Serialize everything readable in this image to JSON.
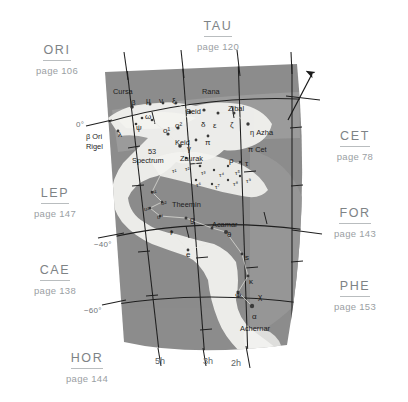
{
  "chart_data": {
    "type": "map",
    "projection": "conic sector",
    "grid": true,
    "declination_labels": [
      "0°",
      "−40°",
      "−60°"
    ],
    "right_ascension_labels": [
      "5h",
      "3h",
      "2h"
    ],
    "north_arrow": "north-arrow",
    "stars": [
      {
        "label": "Cursa",
        "x": 113,
        "y": 88,
        "cls": "nm"
      },
      {
        "label": "β",
        "x": 131,
        "y": 99,
        "cls": "gk"
      },
      {
        "label": "μ",
        "x": 146,
        "y": 97,
        "cls": "gk"
      },
      {
        "label": "ν",
        "x": 159,
        "y": 97,
        "cls": "gk"
      },
      {
        "label": "ξ",
        "x": 172,
        "y": 97,
        "cls": "gk"
      },
      {
        "label": "Rana",
        "x": 202,
        "y": 88,
        "cls": "nm"
      },
      {
        "label": "Beid",
        "x": 186,
        "y": 108,
        "cls": "nm"
      },
      {
        "label": "Zibal",
        "x": 228,
        "y": 105,
        "cls": "nm"
      },
      {
        "label": "ω",
        "x": 145,
        "y": 113,
        "cls": "gk"
      },
      {
        "label": "o²",
        "x": 175,
        "y": 122,
        "cls": "gk"
      },
      {
        "label": "δ",
        "x": 201,
        "y": 121,
        "cls": "gk"
      },
      {
        "label": "ε",
        "x": 213,
        "y": 122,
        "cls": "gk"
      },
      {
        "label": "ζ",
        "x": 230,
        "y": 121,
        "cls": "gk"
      },
      {
        "label": "η Azha",
        "x": 250,
        "y": 129,
        "cls": "nm"
      },
      {
        "label": "ψ",
        "x": 136,
        "y": 124,
        "cls": "gk"
      },
      {
        "label": "λ",
        "x": 118,
        "y": 131,
        "cls": "gk"
      },
      {
        "label": "β Ori",
        "x": 86,
        "y": 133,
        "cls": "nm"
      },
      {
        "label": "Rigel",
        "x": 86,
        "y": 143,
        "cls": "nm"
      },
      {
        "label": "o¹",
        "x": 163,
        "y": 127,
        "cls": "gk"
      },
      {
        "label": "Keid",
        "x": 175,
        "y": 139,
        "cls": "nm"
      },
      {
        "label": "π",
        "x": 205,
        "y": 139,
        "cls": "gk"
      },
      {
        "label": "π Cet",
        "x": 248,
        "y": 146,
        "cls": "nm"
      },
      {
        "label": "53",
        "x": 148,
        "y": 148,
        "cls": "nm"
      },
      {
        "label": "Spectrum",
        "x": 132,
        "y": 157,
        "cls": "nm"
      },
      {
        "label": "γ",
        "x": 187,
        "y": 145,
        "cls": "gk"
      },
      {
        "label": "Zaurak",
        "x": 180,
        "y": 155,
        "cls": "nm"
      },
      {
        "label": "ρ",
        "x": 229,
        "y": 157,
        "cls": "gk"
      },
      {
        "label": "τ",
        "x": 245,
        "y": 160,
        "cls": "gk"
      },
      {
        "label": "τ⁵",
        "x": 235,
        "y": 170,
        "cls": "sm"
      },
      {
        "label": "τ⁴",
        "x": 219,
        "y": 172,
        "cls": "sm"
      },
      {
        "label": "τ³",
        "x": 201,
        "y": 170,
        "cls": "sm"
      },
      {
        "label": "τ²",
        "x": 185,
        "y": 166,
        "cls": "sm"
      },
      {
        "label": "τ¹",
        "x": 172,
        "y": 168,
        "cls": "sm"
      },
      {
        "label": "τ⁶",
        "x": 196,
        "y": 182,
        "cls": "sm"
      },
      {
        "label": "τ⁷",
        "x": 215,
        "y": 184,
        "cls": "sm"
      },
      {
        "label": "τ⁸",
        "x": 233,
        "y": 181,
        "cls": "sm"
      },
      {
        "label": "τ⁹",
        "x": 246,
        "y": 178,
        "cls": "sm"
      },
      {
        "label": "υ¹",
        "x": 151,
        "y": 189,
        "cls": "sm"
      },
      {
        "label": "υ²",
        "x": 161,
        "y": 200,
        "cls": "sm"
      },
      {
        "label": "Theemin",
        "x": 172,
        "y": 201,
        "cls": "nm"
      },
      {
        "label": "υ³",
        "x": 144,
        "y": 206,
        "cls": "sm"
      },
      {
        "label": "υ⁴",
        "x": 157,
        "y": 214,
        "cls": "sm"
      },
      {
        "label": "g",
        "x": 190,
        "y": 216,
        "cls": "gk"
      },
      {
        "label": "Acamar",
        "x": 212,
        "y": 221,
        "cls": "nm"
      },
      {
        "label": "θ",
        "x": 227,
        "y": 231,
        "cls": "gk"
      },
      {
        "label": "f",
        "x": 170,
        "y": 229,
        "cls": "gk"
      },
      {
        "label": "e",
        "x": 186,
        "y": 251,
        "cls": "gk"
      },
      {
        "label": "s",
        "x": 245,
        "y": 254,
        "cls": "gk"
      },
      {
        "label": "κ",
        "x": 249,
        "y": 278,
        "cls": "gk"
      },
      {
        "label": "Φ",
        "x": 235,
        "y": 292,
        "cls": "gk"
      },
      {
        "label": "χ",
        "x": 258,
        "y": 293,
        "cls": "gk"
      },
      {
        "label": "α",
        "x": 252,
        "y": 313,
        "cls": "gk"
      },
      {
        "label": "Achernar",
        "x": 240,
        "y": 325,
        "cls": "nm"
      }
    ]
  },
  "neighbors": [
    {
      "abbr": "ORI",
      "page": "page 106",
      "x": 24,
      "y": 40
    },
    {
      "abbr": "TAU",
      "page": "page 120",
      "x": 185,
      "y": 16
    },
    {
      "abbr": "CET",
      "page": "page 78",
      "x": 322,
      "y": 126
    },
    {
      "abbr": "FOR",
      "page": "page 143",
      "x": 322,
      "y": 203
    },
    {
      "abbr": "PHE",
      "page": "page 153",
      "x": 322,
      "y": 276
    },
    {
      "abbr": "LEP",
      "page": "page 147",
      "x": 22,
      "y": 183
    },
    {
      "abbr": "CAE",
      "page": "page 138",
      "x": 22,
      "y": 260
    },
    {
      "abbr": "HOR",
      "page": "page 144",
      "x": 54,
      "y": 348
    }
  ],
  "declinations": [
    {
      "label": "0°",
      "x": 76,
      "y": 120
    },
    {
      "label": "−40°",
      "x": 94,
      "y": 240
    },
    {
      "label": "−60°",
      "x": 84,
      "y": 306
    }
  ],
  "hours": [
    {
      "label": "5h",
      "x": 155,
      "y": 356
    },
    {
      "label": "3h",
      "x": 203,
      "y": 356
    },
    {
      "label": "2h",
      "x": 231,
      "y": 358
    }
  ],
  "colors": {
    "sky": "#8c8c8c",
    "sky_light": "#9e9e9e",
    "milkyway": "#f2f2ef",
    "label": "#7e8386",
    "rule": "#b9bdbf",
    "grid": "#2b2b2b"
  }
}
